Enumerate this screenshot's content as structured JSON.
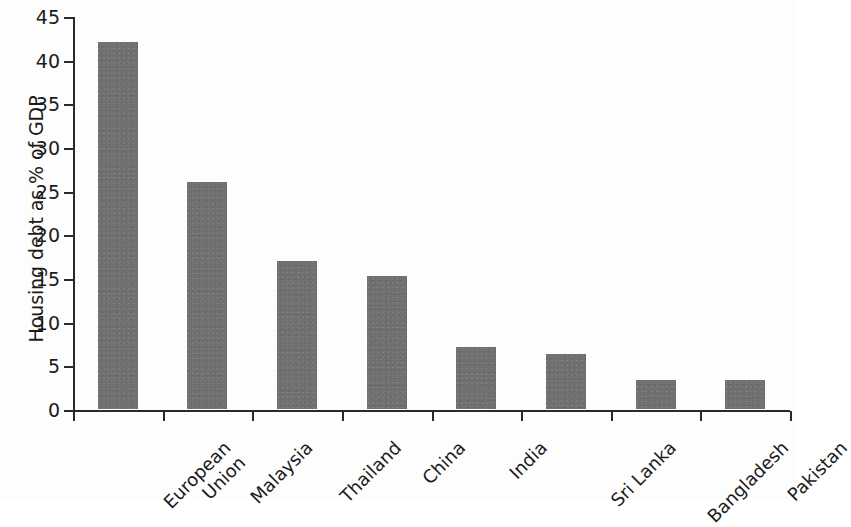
{
  "chart_data": {
    "type": "bar",
    "title": "",
    "subtitle": "",
    "xlabel": "",
    "ylabel": "Housing debt as % of GDP",
    "ylim": [
      0,
      45
    ],
    "ytick_values": [
      0,
      5,
      10,
      15,
      20,
      25,
      30,
      35,
      40,
      45
    ],
    "ytick_labels": [
      "0",
      "5",
      "10",
      "15",
      "20",
      "25",
      "30",
      "35",
      "40",
      "45"
    ],
    "grid": false,
    "legend": null,
    "bar_color": "#6f6f6f",
    "axis_color": "#2a2a2a",
    "categories": [
      "European Union",
      "Malaysia",
      "Thailand",
      "China",
      "India",
      "Sri Lanka",
      "Bangladesh",
      "Pakistan"
    ],
    "category_lines": [
      [
        "European",
        "Union"
      ],
      [
        "Malaysia"
      ],
      [
        "Thailand"
      ],
      [
        "China"
      ],
      [
        "India"
      ],
      [
        "Sri Lanka"
      ],
      [
        "Bangladesh"
      ],
      [
        "Pakistan"
      ]
    ],
    "values": [
      42,
      26,
      17,
      15.2,
      7.1,
      6.3,
      3.3,
      3.3
    ]
  }
}
